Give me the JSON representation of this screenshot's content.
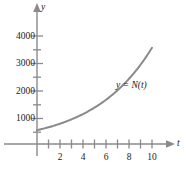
{
  "chart_data": {
    "type": "line",
    "title": "",
    "subtitle": "",
    "xlabel": "t",
    "ylabel": "y",
    "xlim": [
      -0.6,
      11.6
    ],
    "ylim": [
      0,
      4400
    ],
    "grid": false,
    "legend_position": "inline-annotation",
    "x_major_ticks": [
      1,
      2,
      3,
      4,
      5,
      6,
      7,
      8,
      9,
      10
    ],
    "x_tick_labels": [
      "",
      "2",
      "",
      "4",
      "",
      "6",
      "",
      "8",
      "",
      "10"
    ],
    "x_labeled_ticks": [
      {
        "value": 2,
        "label": "2"
      },
      {
        "value": 4,
        "label": "4"
      },
      {
        "value": 6,
        "label": "6"
      },
      {
        "value": 8,
        "label": "8"
      },
      {
        "value": 10,
        "label": "10"
      }
    ],
    "y_major_ticks": [
      1000,
      2000,
      3000,
      4000
    ],
    "y_minor_ticks": [
      500,
      1500,
      2500,
      3500
    ],
    "y_tick_labels": [
      "1000",
      "2000",
      "3000",
      "4000"
    ],
    "annotations": [
      {
        "text": "y = N(t)",
        "x": 7.6,
        "y": 2050
      }
    ],
    "series": [
      {
        "name": "y = N(t)",
        "color": "#8a8a8a",
        "x": [
          0,
          0.5,
          1,
          1.5,
          2,
          2.5,
          3,
          3.5,
          4,
          4.5,
          5,
          5.5,
          6,
          6.5,
          7,
          7.5,
          8,
          8.5,
          9,
          9.5,
          10
        ],
        "values": [
          500,
          524,
          551,
          579,
          609,
          641,
          675,
          711,
          751,
          794,
          841,
          894,
          954,
          1022,
          1100,
          1192,
          1300,
          1430,
          1588,
          1782,
          2020
        ]
      }
    ]
  },
  "axes": {
    "y_axis_name": "y",
    "x_axis_name": "t"
  },
  "curve": {
    "label": "y = N(t)",
    "color": "#8a8a8a"
  },
  "ticks": {
    "y": [
      {
        "label": "4000"
      },
      {
        "label": "3000"
      },
      {
        "label": "2000"
      },
      {
        "label": "1000"
      }
    ],
    "x": [
      {
        "label": "2"
      },
      {
        "label": "4"
      },
      {
        "label": "6"
      },
      {
        "label": "8"
      },
      {
        "label": "10"
      }
    ]
  },
  "style": {
    "axis_color": "#8a8a8a",
    "text_color": "#1a1a1a",
    "background": "#ffffff"
  }
}
